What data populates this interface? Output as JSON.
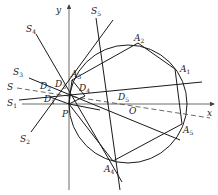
{
  "figure": {
    "type": "geometry-diagram",
    "axes": {
      "x_label": "x",
      "y_label": "y"
    },
    "circle": {
      "center_label": "O"
    },
    "point_labels": {
      "P": "P",
      "O": "O",
      "A1": "A",
      "A1_sub": "1",
      "A2": "A",
      "A2_sub": "2",
      "A3": "A",
      "A3_sub": "3",
      "A4": "A",
      "A4_sub": "4",
      "A5": "A",
      "A5_sub": "5",
      "D1": "D",
      "D1_sub": "1",
      "D2": "D",
      "D2_sub": "2",
      "D3": "D",
      "D3_sub": "3",
      "D4": "D",
      "D4_sub": "4",
      "D5": "D",
      "D5_sub": "5"
    },
    "line_labels": {
      "S": "S",
      "S1": "S",
      "S1_sub": "1",
      "S2": "S",
      "S2_sub": "2",
      "S3": "S",
      "S3_sub": "3",
      "S4": "S",
      "S4_sub": "4",
      "S5": "S",
      "S5_sub": "5"
    }
  }
}
